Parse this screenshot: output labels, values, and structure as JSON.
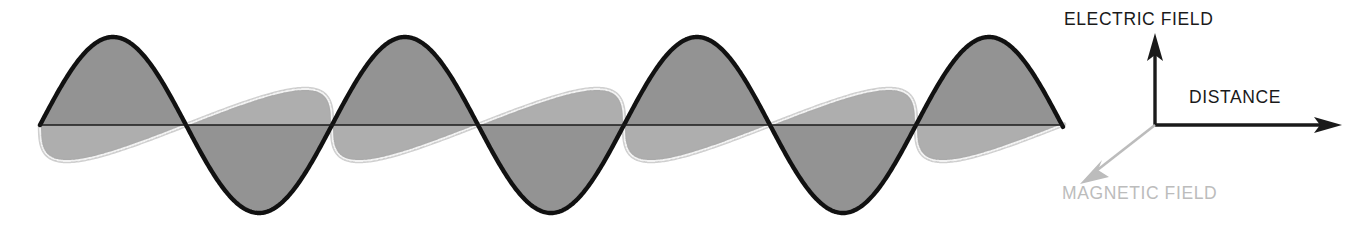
{
  "figure": {
    "background_color": "#ffffff"
  },
  "axes": {
    "origin": {
      "x": 1155,
      "y": 125
    },
    "vertical": {
      "label": "ELECTRIC FIELD",
      "color": "#1a1a1a",
      "direction": "up",
      "tip": {
        "x": 1155,
        "y": 36
      }
    },
    "horizontal": {
      "label": "DISTANCE",
      "color": "#1a1a1a",
      "direction": "right",
      "tip": {
        "x": 1341,
        "y": 125
      }
    },
    "depth": {
      "label": "MAGNETIC FIELD",
      "color": "#bcbcbc",
      "direction": "down-left",
      "tip": {
        "x": 1081,
        "y": 183
      }
    }
  },
  "colors": {
    "electric_stroke": "#111111",
    "electric_fill": "#9a9a9a",
    "electric_fill_back": "#8e8e8e",
    "magnetic_stroke": "#cfcfcf",
    "magnetic_fill": "#d4d4d4",
    "magnetic_fill_back": "#c8c8c8",
    "baseline": "#1a1a1a",
    "label_dark": "#1a1a1a",
    "label_light": "#bcbcbc"
  },
  "chart_data": {
    "type": "line",
    "title": "",
    "xlabel": "DISTANCE",
    "ylabel": "ELECTRIC FIELD",
    "zlabel": "MAGNETIC FIELD",
    "grid": false,
    "legend_position": "none",
    "baseline_y": 125,
    "x_start": 40,
    "x_end": 1063,
    "wavelength_px": 292,
    "cycles": 3.5,
    "series": [
      {
        "name": "ELECTRIC FIELD",
        "plane": "vertical",
        "amplitude_px": 88,
        "phase": 0,
        "stroke": "#111111",
        "fill": "#9a9a9a",
        "peaks_x": [
          113,
          405,
          697,
          990
        ],
        "troughs_x": [
          259,
          551,
          843
        ],
        "zeros_x": [
          40,
          186,
          332,
          478,
          624,
          770,
          916,
          1063
        ]
      },
      {
        "name": "MAGNETIC FIELD",
        "plane": "horizontal-perspective",
        "amplitude_px": 88,
        "phase": 0,
        "projection_dx": -46,
        "projection_dy": 36,
        "stroke": "#cfcfcf",
        "fill": "#d4d4d4",
        "peaks_x": [
          113,
          405,
          697,
          990
        ],
        "troughs_x": [
          259,
          551,
          843
        ],
        "zeros_x": [
          40,
          186,
          332,
          478,
          624,
          770,
          916,
          1063
        ]
      }
    ]
  }
}
